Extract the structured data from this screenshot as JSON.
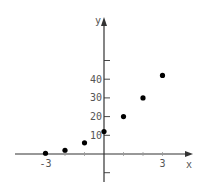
{
  "chart_data": {
    "type": "scatter",
    "title": "",
    "xlabel": "x",
    "ylabel": "y",
    "x_tick_labels": [
      "-3",
      "3"
    ],
    "y_tick_labels": [
      "10",
      "20",
      "30",
      "40"
    ],
    "xlim": [
      -5,
      4.5
    ],
    "ylim": [
      -10,
      70
    ],
    "grid": false,
    "legend": null,
    "series": [
      {
        "name": "points",
        "x": [
          -3,
          -2,
          -1,
          0,
          1,
          2,
          3
        ],
        "y": [
          0.4,
          2,
          6,
          12,
          20,
          30,
          42
        ]
      }
    ]
  },
  "colors": {
    "axis": "#333333",
    "point": "#000000",
    "label": "#555555"
  }
}
